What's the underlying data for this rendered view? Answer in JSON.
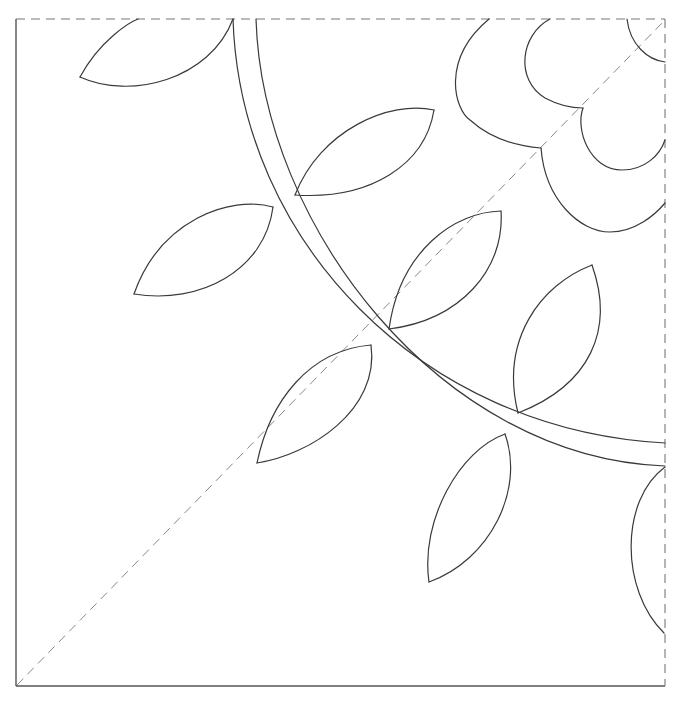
{
  "pattern": {
    "type": "quilting-block-quarter",
    "colors": {
      "background": "#ffffff",
      "line": "#3a3a3a",
      "frame": "#555555",
      "dashed_guide": "#777777"
    },
    "frame": {
      "left": 16,
      "top": 19,
      "right": 665,
      "bottom": 686,
      "solid_edges": [
        "left",
        "bottom"
      ],
      "dashed_edges": [
        "top",
        "right"
      ]
    },
    "diagonal_guide": {
      "from": [
        17,
        685
      ],
      "to": [
        665,
        20
      ],
      "style": "dashed"
    },
    "vine": {
      "outer": "M233,19 C240,240 420,430 665,443",
      "inner": "M256,19 C262,225 440,458 665,466"
    },
    "flower": {
      "outer_petal_upper": "M489,19 C440,60 455,110 470,120 C490,138 515,146 541,148",
      "outer_petal_lower": "M541,148 C545,200 580,232 610,232 C635,232 655,215 665,203",
      "inner_petal_upper": "M550,19 C520,35 515,80 545,98 C560,106 572,108 583,108",
      "inner_petal_lower": "M583,108 C575,130 590,170 622,170 C645,170 660,155 665,140",
      "corner_arc": "M627,19 C630,45 648,60 665,62"
    },
    "leaves": [
      {
        "name": "leaf-top-left",
        "upper": "M80,77 C100,40 130,22 138,19",
        "lower": "M80,77 C130,100 210,80 233,19"
      },
      {
        "name": "leaf-left-mid",
        "upper": "M134,294 C160,220 230,195 273,207",
        "lower": "M134,294 C200,305 265,270 273,207"
      },
      {
        "name": "leaf-upper-vine",
        "upper": "M295,195 C320,130 390,100 434,110",
        "lower": "M295,195 C370,200 425,165 434,110"
      },
      {
        "name": "leaf-center-up",
        "upper": "M389,329 C400,250 455,212 501,211",
        "lower": "M389,329 C460,320 505,270 501,211"
      },
      {
        "name": "leaf-center-down",
        "upper": "M371,345 C310,350 270,400 257,463",
        "lower": "M371,345 C380,410 310,455 257,463"
      },
      {
        "name": "leaf-right-up",
        "upper": "M518,413 C500,340 540,285 592,265",
        "lower": "M518,413 C590,385 615,330 592,265"
      },
      {
        "name": "leaf-right-down",
        "upper": "M505,434 C460,450 420,520 429,582",
        "lower": "M505,434 C525,490 490,560 429,582"
      },
      {
        "name": "leaf-edge-half",
        "upper": "M665,467 C620,500 620,590 664,633",
        "lower": ""
      }
    ]
  }
}
